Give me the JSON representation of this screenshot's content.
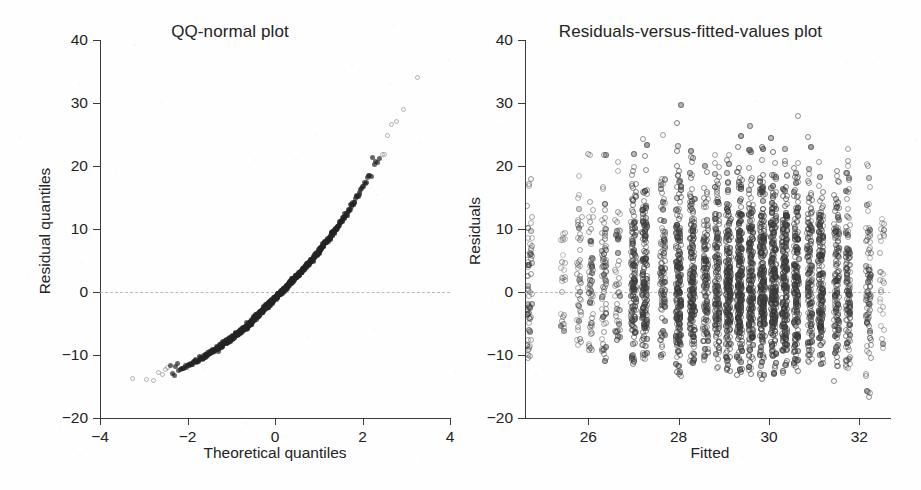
{
  "figure": {
    "width": 921,
    "height": 490,
    "background": "#fefefe",
    "panel_count": 2
  },
  "panels": [
    {
      "id": "qq-normal",
      "title": "QQ-normal plot",
      "xlabel": "Theoretical quantiles",
      "ylabel": "Residual quantiles"
    },
    {
      "id": "residuals-vs-fitted",
      "title": "Residuals-versus-fitted-values plot",
      "xlabel": "Fitted",
      "ylabel": "Residuals"
    }
  ],
  "colors": {
    "axis": "#3a3a3a",
    "text": "#232323",
    "point": "#4a4a4a",
    "reference_line": "#b9b9b9",
    "background": "#fefefe"
  },
  "chart_data": [
    {
      "type": "scatter",
      "title": "QQ-normal plot",
      "xlabel": "Theoretical quantiles",
      "ylabel": "Residual quantiles",
      "xlim": [
        -4,
        4
      ],
      "ylim": [
        -20,
        40
      ],
      "xticks": [
        -4,
        -2,
        0,
        2,
        4
      ],
      "xticklabels": [
        "-4",
        "-2",
        "0",
        "2",
        "4"
      ],
      "yticks": [
        -20,
        -10,
        0,
        10,
        20,
        30,
        40
      ],
      "yticklabels": [
        "-20",
        "-10",
        "0",
        "10",
        "20",
        "30",
        "40"
      ],
      "grid": false,
      "legend": "none",
      "annotations": [
        {
          "type": "hline",
          "y": 0,
          "style": "dashed",
          "color": "#b9b9b9"
        }
      ],
      "n_points": 900,
      "description": "Dense S-shaped band of points rising monotonically from (-3.8,-17.8) through (0,-1.5) to (3.8,36); right-skewed with heavy upper tail.",
      "curve_anchors": {
        "x": [
          -3.8,
          -3.5,
          -3.2,
          -3.0,
          -2.6,
          -2.2,
          -1.8,
          -1.4,
          -1.0,
          -0.6,
          -0.2,
          0.0,
          0.2,
          0.6,
          1.0,
          1.4,
          1.8,
          2.1,
          2.4,
          2.7,
          3.0,
          3.2,
          3.4,
          3.6,
          3.8
        ],
        "y": [
          -17.8,
          -15.4,
          -14.8,
          -14.4,
          -13.4,
          -12.3,
          -11.0,
          -9.3,
          -7.4,
          -5.2,
          -2.3,
          -1.0,
          0.4,
          3.2,
          6.4,
          10.0,
          14.2,
          17.8,
          21.6,
          25.8,
          30.0,
          32.5,
          34.4,
          35.3,
          36.2
        ]
      }
    },
    {
      "type": "scatter",
      "title": "Residuals-versus-fitted-values plot",
      "xlabel": "Fitted",
      "ylabel": "Residuals",
      "xlim": [
        24.6,
        32.7
      ],
      "ylim": [
        -20,
        40
      ],
      "xticks": [
        26,
        28,
        30,
        32
      ],
      "xticklabels": [
        "26",
        "28",
        "30",
        "32"
      ],
      "yticks": [
        -20,
        -10,
        0,
        10,
        20,
        30,
        40
      ],
      "yticklabels": [
        "-20",
        "-10",
        "0",
        "10",
        "20",
        "30",
        "40"
      ],
      "grid": false,
      "legend": "none",
      "annotations": [
        {
          "type": "hline",
          "y": 0,
          "style": "dashed",
          "color": "#b9b9b9"
        }
      ],
      "n_points": 3200,
      "description": "Residuals plotted against discrete fitted values forming vertical stripes; spread widens with fitted value, residuals range about -18 to +37, centred near 0.",
      "columns": [
        {
          "x": 24.7,
          "n": 70,
          "low": -10.5,
          "high": 18.0,
          "density": 0.35
        },
        {
          "x": 25.45,
          "n": 26,
          "low": -6.5,
          "high": 9.5,
          "density": 0.22
        },
        {
          "x": 25.8,
          "n": 46,
          "low": -8.5,
          "high": 19.5,
          "density": 0.3
        },
        {
          "x": 26.05,
          "n": 60,
          "low": -9.5,
          "high": 22.5,
          "density": 0.34
        },
        {
          "x": 26.35,
          "n": 78,
          "low": -11.0,
          "high": 23.0,
          "density": 0.4
        },
        {
          "x": 26.65,
          "n": 52,
          "low": -8.0,
          "high": 21.5,
          "density": 0.3
        },
        {
          "x": 27.0,
          "n": 150,
          "low": -12.0,
          "high": 30.5,
          "density": 0.55
        },
        {
          "x": 27.25,
          "n": 165,
          "low": -11.5,
          "high": 28.0,
          "density": 0.58
        },
        {
          "x": 27.65,
          "n": 110,
          "low": -10.5,
          "high": 25.5,
          "density": 0.45
        },
        {
          "x": 28.0,
          "n": 190,
          "low": -13.5,
          "high": 34.5,
          "density": 0.62
        },
        {
          "x": 28.3,
          "n": 175,
          "low": -12.0,
          "high": 26.0,
          "density": 0.6
        },
        {
          "x": 28.6,
          "n": 140,
          "low": -11.0,
          "high": 24.5,
          "density": 0.52
        },
        {
          "x": 28.85,
          "n": 160,
          "low": -12.5,
          "high": 29.0,
          "density": 0.56
        },
        {
          "x": 29.1,
          "n": 200,
          "low": -13.0,
          "high": 27.0,
          "density": 0.66
        },
        {
          "x": 29.35,
          "n": 210,
          "low": -14.0,
          "high": 28.5,
          "density": 0.68
        },
        {
          "x": 29.6,
          "n": 185,
          "low": -13.5,
          "high": 26.5,
          "density": 0.62
        },
        {
          "x": 29.85,
          "n": 215,
          "low": -14.0,
          "high": 29.5,
          "density": 0.7
        },
        {
          "x": 30.1,
          "n": 225,
          "low": -13.5,
          "high": 36.5,
          "density": 0.72
        },
        {
          "x": 30.35,
          "n": 200,
          "low": -13.0,
          "high": 33.5,
          "density": 0.66
        },
        {
          "x": 30.6,
          "n": 180,
          "low": -12.5,
          "high": 31.0,
          "density": 0.6
        },
        {
          "x": 30.9,
          "n": 150,
          "low": -12.0,
          "high": 29.5,
          "density": 0.54
        },
        {
          "x": 31.15,
          "n": 165,
          "low": -12.5,
          "high": 32.5,
          "density": 0.58
        },
        {
          "x": 31.5,
          "n": 140,
          "low": -14.5,
          "high": 30.0,
          "density": 0.52
        },
        {
          "x": 31.75,
          "n": 120,
          "low": -12.5,
          "high": 32.5,
          "density": 0.46
        },
        {
          "x": 32.2,
          "n": 90,
          "low": -17.5,
          "high": 32.0,
          "density": 0.38
        },
        {
          "x": 32.5,
          "n": 30,
          "low": -9.5,
          "high": 17.0,
          "density": 0.22
        }
      ]
    }
  ]
}
